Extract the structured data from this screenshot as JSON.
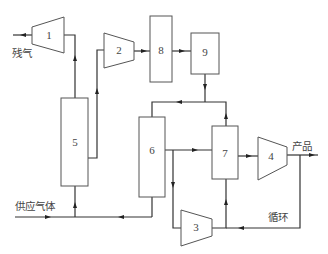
{
  "diagram": {
    "units": [
      {
        "id": "1",
        "label": "1",
        "type": "compressor"
      },
      {
        "id": "2",
        "label": "2",
        "type": "compressor"
      },
      {
        "id": "3",
        "label": "3",
        "type": "compressor"
      },
      {
        "id": "4",
        "label": "4",
        "type": "compressor"
      },
      {
        "id": "5",
        "label": "5",
        "type": "vessel"
      },
      {
        "id": "6",
        "label": "6",
        "type": "vessel"
      },
      {
        "id": "7",
        "label": "7",
        "type": "vessel"
      },
      {
        "id": "8",
        "label": "8",
        "type": "vessel"
      },
      {
        "id": "9",
        "label": "9",
        "type": "vessel"
      }
    ],
    "stream_labels": {
      "residual_gas": "残气",
      "feed_gas": "供应气体",
      "product": "产品",
      "recycle": "循环"
    },
    "colors": {
      "line": "#333333",
      "outline": "#555555",
      "text": "#444444",
      "background": "#ffffff"
    }
  }
}
